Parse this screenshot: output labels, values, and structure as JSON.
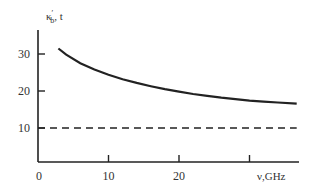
{
  "chart_data": {
    "type": "line",
    "title": "",
    "xlabel": "ν,GHz",
    "ylabel": "κ′b, t",
    "ylabel_parts": {
      "main": "κ",
      "prime": "′",
      "sub": "b",
      "rest": ", t"
    },
    "xlim": [
      0,
      38
    ],
    "ylim": [
      0,
      36
    ],
    "x_ticks": [
      {
        "value": 0,
        "label": "0"
      },
      {
        "value": 10,
        "label": "10"
      },
      {
        "value": 20,
        "label": "20"
      },
      {
        "value": 30,
        "label": ""
      }
    ],
    "y_ticks": [
      {
        "value": 10,
        "label": "10"
      },
      {
        "value": 20,
        "label": "20"
      },
      {
        "value": 30,
        "label": "30"
      }
    ],
    "grid": false,
    "legend": null,
    "series": [
      {
        "name": "κ′b",
        "style": "solid",
        "color": "#222222",
        "x": [
          2.9,
          4,
          6,
          8,
          10,
          12,
          14,
          16,
          18,
          20,
          22,
          24,
          26,
          28,
          30,
          32,
          34,
          36.7
        ],
        "values": [
          31.5,
          29.8,
          27.5,
          25.8,
          24.4,
          23.2,
          22.2,
          21.3,
          20.5,
          19.8,
          19.2,
          18.7,
          18.2,
          17.8,
          17.4,
          17.1,
          16.9,
          16.6
        ]
      },
      {
        "name": "t",
        "style": "dashed",
        "color": "#222222",
        "x": [
          0,
          36.7
        ],
        "values": [
          10,
          10
        ]
      }
    ]
  }
}
